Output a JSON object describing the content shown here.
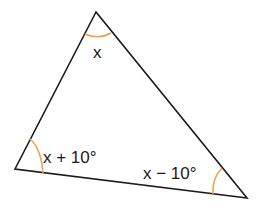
{
  "diagram": {
    "type": "triangle",
    "vertices": {
      "top": {
        "x": 96,
        "y": 12
      },
      "left": {
        "x": 15,
        "y": 169
      },
      "right": {
        "x": 247,
        "y": 198
      }
    },
    "angles": [
      {
        "vertex": "top",
        "label": "x"
      },
      {
        "vertex": "left",
        "label": "x + 10°"
      },
      {
        "vertex": "right",
        "label": "x − 10°"
      }
    ],
    "colors": {
      "edge": "#1a1a1a",
      "arc": "#f0a050"
    }
  }
}
